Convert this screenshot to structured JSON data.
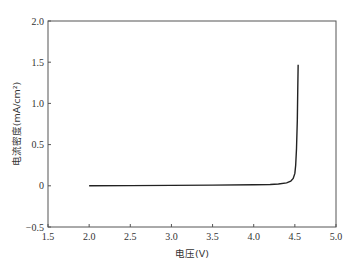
{
  "chart_data": {
    "type": "line",
    "title": "",
    "xlabel": "电压(V)",
    "ylabel": "电流密度(mA/cm²)",
    "xlim": [
      1.5,
      5.0
    ],
    "ylim": [
      -0.5,
      2.0
    ],
    "xticks": [
      1.5,
      2.0,
      2.5,
      3.0,
      3.5,
      4.0,
      4.5,
      5.0
    ],
    "xtick_labels": [
      "1.5",
      "2.0",
      "2.5",
      "3.0",
      "3.5",
      "4.0",
      "4.5",
      "5.0"
    ],
    "yticks": [
      -0.5,
      0,
      0.5,
      1.0,
      1.5,
      2.0
    ],
    "ytick_labels": [
      "−0.5",
      "0",
      "0.5",
      "1.0",
      "1.5",
      "2.0"
    ],
    "grid": false,
    "legend": null,
    "series": [
      {
        "name": "J-V",
        "color": "#222222",
        "x": [
          2.0,
          2.5,
          3.0,
          3.5,
          4.0,
          4.2,
          4.3,
          4.4,
          4.45,
          4.48,
          4.5,
          4.51,
          4.52,
          4.53,
          4.535,
          4.54
        ],
        "y": [
          0.0,
          0.002,
          0.005,
          0.008,
          0.012,
          0.016,
          0.022,
          0.035,
          0.055,
          0.09,
          0.15,
          0.25,
          0.45,
          0.8,
          1.15,
          1.47
        ]
      }
    ]
  }
}
